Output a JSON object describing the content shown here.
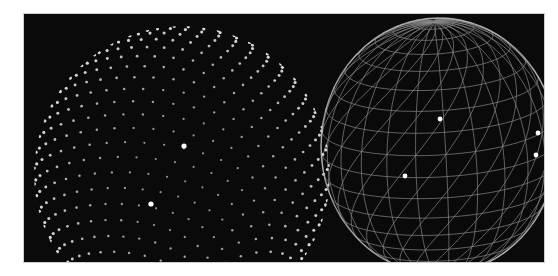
{
  "figure": {
    "background": "#0a0a0a",
    "panels": [
      {
        "name": "point-cloud-sphere",
        "style": "dots",
        "color": "#e6e6e6",
        "highlights": 2
      },
      {
        "name": "wireframe-sphere",
        "style": "triangle-mesh",
        "color": "#bdbdbd",
        "highlights": 4
      }
    ]
  }
}
